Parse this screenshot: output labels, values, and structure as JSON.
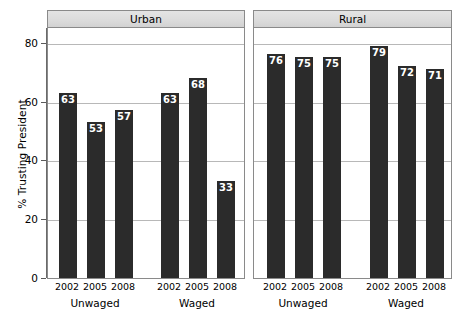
{
  "chart_data": {
    "type": "bar",
    "title": "",
    "xlabel": "",
    "ylabel": "% Trusting President",
    "ylim": [
      0,
      85
    ],
    "yticks": [
      0,
      20,
      40,
      60,
      80
    ],
    "ytick_labels": [
      "0",
      "20",
      "40",
      "60",
      "80"
    ],
    "grid": true,
    "legend": "none",
    "orientation": "vertical",
    "bar_color": "#2b2b2b",
    "value_label_color": "#ffffff",
    "panel_strip_color": "#dcdcdc",
    "panels": [
      {
        "name": "Urban",
        "groups": [
          {
            "name": "Unwaged",
            "categories": [
              "2002",
              "2005",
              "2008"
            ],
            "values": [
              63,
              53,
              57
            ]
          },
          {
            "name": "Waged",
            "categories": [
              "2002",
              "2005",
              "2008"
            ],
            "values": [
              63,
              68,
              33
            ]
          }
        ]
      },
      {
        "name": "Rural",
        "groups": [
          {
            "name": "Unwaged",
            "categories": [
              "2002",
              "2005",
              "2008"
            ],
            "values": [
              76,
              75,
              75
            ]
          },
          {
            "name": "Waged",
            "categories": [
              "2002",
              "2005",
              "2008"
            ],
            "values": [
              79,
              72,
              71
            ]
          }
        ]
      }
    ]
  }
}
